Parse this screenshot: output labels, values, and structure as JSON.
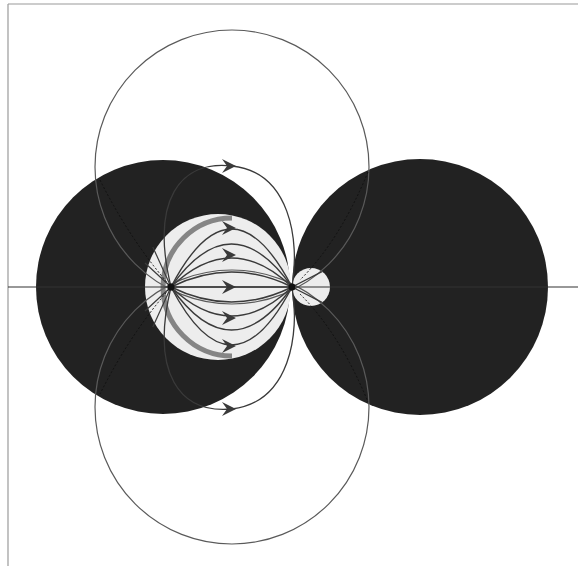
{
  "figure": {
    "type": "field-line diagram",
    "colors": {
      "background": "#ffffff",
      "frame": "#9a9a9a",
      "dark_region": "#222222",
      "light_region": "#ededed",
      "field_line": "#3a3a3a",
      "thick_arc": "#6a6a6a",
      "outer_circle": "#5a5a5a"
    },
    "axis": {
      "y": 287
    },
    "dark_circles": [
      {
        "id": "left",
        "cx": 163,
        "cy": 287,
        "r": 127
      },
      {
        "id": "right",
        "cx": 420,
        "cy": 287,
        "r": 128
      }
    ],
    "light_circles": [
      {
        "id": "main",
        "cx": 218,
        "cy": 287,
        "r": 73
      },
      {
        "id": "small",
        "cx": 311,
        "cy": 287,
        "r": 19
      }
    ],
    "outer_circles": [
      {
        "id": "top",
        "cx": 232,
        "cy": 167,
        "r": 137
      },
      {
        "id": "bottom",
        "cx": 232,
        "cy": 407,
        "r": 137
      }
    ],
    "poles": [
      {
        "id": "source",
        "x": 171,
        "y": 287
      },
      {
        "id": "sink",
        "x": 292,
        "y": 287
      }
    ],
    "inner_field_line_bulges": [
      -58,
      -43,
      -29,
      -15,
      0,
      15,
      29,
      43,
      58
    ],
    "arrow_y_positions": [
      228,
      255,
      287,
      318,
      346
    ],
    "outer_arrows": [
      {
        "x": 232,
        "y": 166
      },
      {
        "x": 232,
        "y": 409
      }
    ]
  }
}
